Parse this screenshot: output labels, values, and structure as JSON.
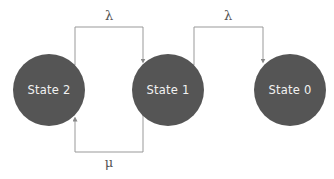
{
  "diagram": {
    "title": "",
    "type": "state-transition",
    "colors": {
      "node_fill": "#555555",
      "node_text": "#f2f2f2",
      "edge_stroke": "#999999",
      "label_text": "#555555",
      "background": "#ffffff"
    },
    "nodes": [
      {
        "id": "state2",
        "label": "State 2"
      },
      {
        "id": "state1",
        "label": "State 1"
      },
      {
        "id": "state0",
        "label": "State 0"
      }
    ],
    "edges": [
      {
        "from": "state2",
        "to": "state1",
        "label": "λ",
        "route": "top"
      },
      {
        "from": "state1",
        "to": "state0",
        "label": "λ",
        "route": "top"
      },
      {
        "from": "state1",
        "to": "state2",
        "label": "μ",
        "route": "bottom"
      }
    ]
  }
}
